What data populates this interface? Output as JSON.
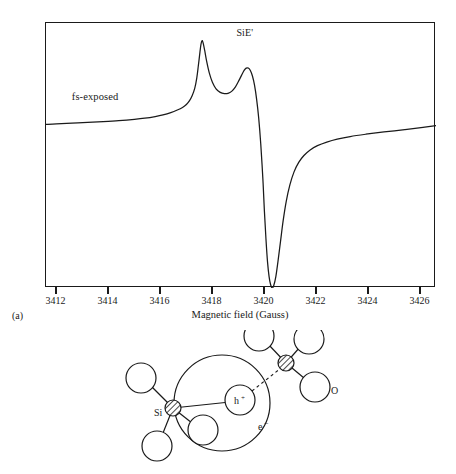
{
  "figure": {
    "panels": [
      {
        "tag": "(a)",
        "kind": "epr-spectrum"
      },
      {
        "tag": "(b)",
        "kind": "defect-structure-diagram"
      }
    ]
  },
  "chart_data": {
    "type": "line",
    "title": "",
    "subtitle": "",
    "xlabel": "Magnetic field (Gauss)",
    "ylabel": "",
    "xlim": [
      3411.6,
      3426.6
    ],
    "ylim": [
      -1.0,
      0.62
    ],
    "grid": false,
    "legend_position": "inline",
    "xticks": [
      3412,
      3414,
      3416,
      3418,
      3420,
      3422,
      3424,
      3426
    ],
    "xticklabels": [
      "3412",
      "3414",
      "3416",
      "3418",
      "3420",
      "3422",
      "3424",
      "3426"
    ],
    "yticks": [],
    "yticklabels": [],
    "annotations": [
      {
        "text": "fs-exposed",
        "x": 3412.4,
        "y": 0.11
      },
      {
        "text": "SiE'",
        "x": 3419.5,
        "y": 0.55
      }
    ],
    "series": [
      {
        "name": "fs-exposed",
        "color": "#1a1a1a",
        "points": [
          [
            3411.6,
            0.0
          ],
          [
            3412.0,
            0.004
          ],
          [
            3412.6,
            0.008
          ],
          [
            3413.2,
            0.012
          ],
          [
            3413.8,
            0.017
          ],
          [
            3414.4,
            0.023
          ],
          [
            3415.0,
            0.031
          ],
          [
            3415.4,
            0.038
          ],
          [
            3415.8,
            0.048
          ],
          [
            3416.1,
            0.058
          ],
          [
            3416.4,
            0.072
          ],
          [
            3416.65,
            0.088
          ],
          [
            3416.85,
            0.104
          ],
          [
            3417.0,
            0.122
          ],
          [
            3417.12,
            0.145
          ],
          [
            3417.22,
            0.175
          ],
          [
            3417.32,
            0.22
          ],
          [
            3417.4,
            0.285
          ],
          [
            3417.46,
            0.36
          ],
          [
            3417.52,
            0.44
          ],
          [
            3417.56,
            0.49
          ],
          [
            3417.6,
            0.512
          ],
          [
            3417.64,
            0.5
          ],
          [
            3417.7,
            0.455
          ],
          [
            3417.78,
            0.385
          ],
          [
            3417.88,
            0.315
          ],
          [
            3418.0,
            0.258
          ],
          [
            3418.14,
            0.218
          ],
          [
            3418.3,
            0.196
          ],
          [
            3418.46,
            0.188
          ],
          [
            3418.6,
            0.19
          ],
          [
            3418.74,
            0.202
          ],
          [
            3418.88,
            0.228
          ],
          [
            3419.0,
            0.262
          ],
          [
            3419.12,
            0.3
          ],
          [
            3419.22,
            0.33
          ],
          [
            3419.3,
            0.344
          ],
          [
            3419.38,
            0.345
          ],
          [
            3419.46,
            0.33
          ],
          [
            3419.54,
            0.296
          ],
          [
            3419.62,
            0.24
          ],
          [
            3419.7,
            0.155
          ],
          [
            3419.78,
            0.04
          ],
          [
            3419.86,
            -0.12
          ],
          [
            3419.94,
            -0.33
          ],
          [
            3420.0,
            -0.53
          ],
          [
            3420.06,
            -0.7
          ],
          [
            3420.12,
            -0.84
          ],
          [
            3420.18,
            -0.93
          ],
          [
            3420.24,
            -0.98
          ],
          [
            3420.3,
            -1.0
          ],
          [
            3420.36,
            -0.985
          ],
          [
            3420.44,
            -0.93
          ],
          [
            3420.52,
            -0.84
          ],
          [
            3420.62,
            -0.715
          ],
          [
            3420.72,
            -0.59
          ],
          [
            3420.84,
            -0.47
          ],
          [
            3420.98,
            -0.37
          ],
          [
            3421.14,
            -0.29
          ],
          [
            3421.32,
            -0.232
          ],
          [
            3421.52,
            -0.19
          ],
          [
            3421.76,
            -0.156
          ],
          [
            3422.04,
            -0.13
          ],
          [
            3422.4,
            -0.108
          ],
          [
            3422.8,
            -0.09
          ],
          [
            3423.3,
            -0.074
          ],
          [
            3423.9,
            -0.06
          ],
          [
            3424.6,
            -0.046
          ],
          [
            3425.4,
            -0.032
          ],
          [
            3426.1,
            -0.018
          ],
          [
            3426.6,
            -0.008
          ]
        ]
      }
    ],
    "features": {
      "baseline_value": 0.0,
      "first_peak": {
        "x": 3417.6,
        "y": 0.512,
        "label": "positive lobe 1"
      },
      "shoulder_minimum": {
        "x": 3418.46,
        "y": 0.188
      },
      "second_peak": {
        "x": 3419.34,
        "y": 0.345,
        "label": "positive lobe 2"
      },
      "trough": {
        "x": 3420.3,
        "y": -1.0,
        "label": "negative lobe"
      }
    }
  },
  "diagram": {
    "label_si": "Si",
    "label_o": "O",
    "label_hole": "h",
    "label_hole_sup": "+",
    "label_electron": "e",
    "label_electron_sup": "−"
  }
}
